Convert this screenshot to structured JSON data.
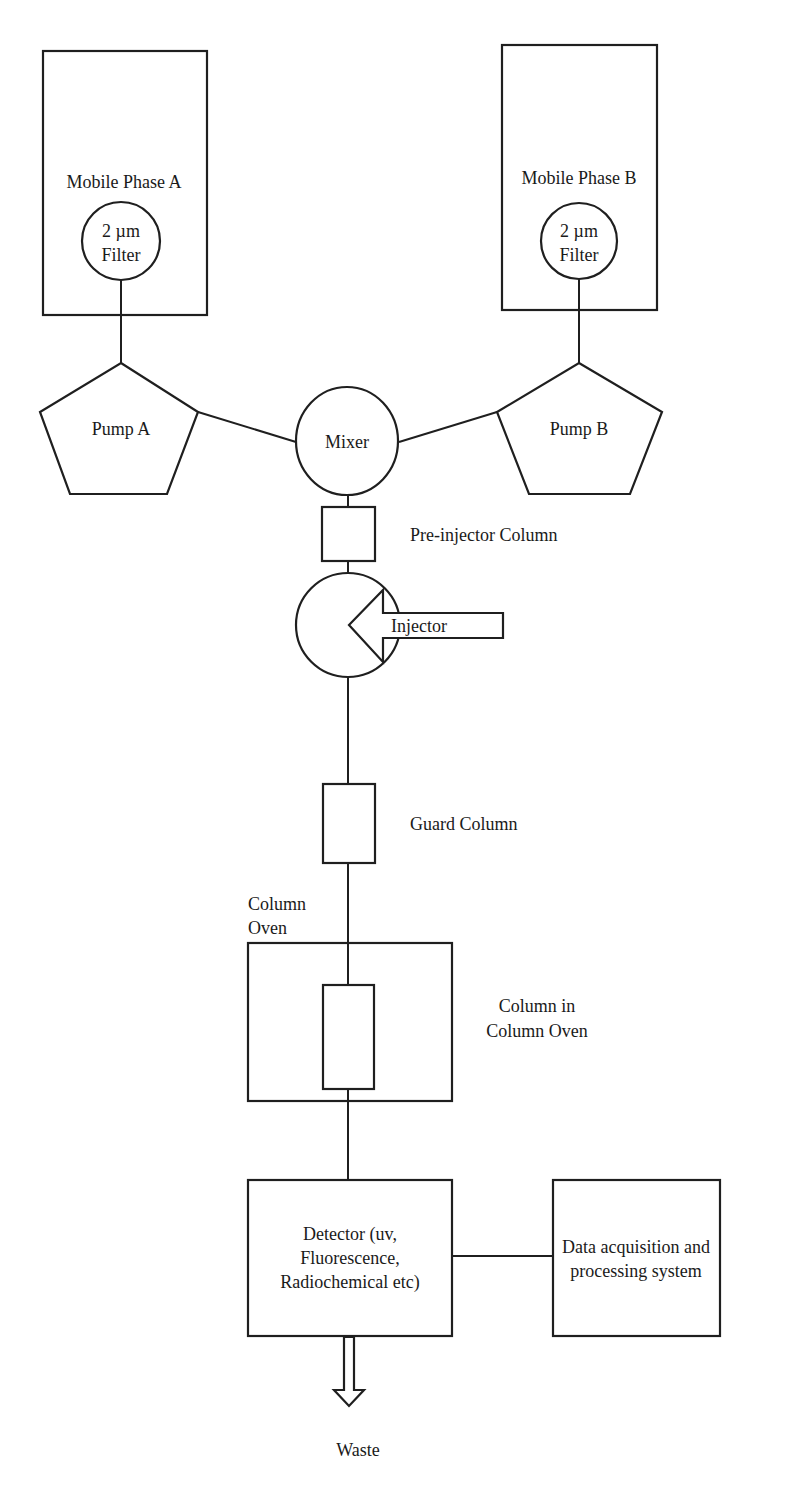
{
  "diagram": {
    "type": "HPLC system schematic",
    "nodes": {
      "mobile_phase_a": {
        "label": "Mobile Phase A"
      },
      "filter_a": {
        "line1": "2 µm",
        "line2": "Filter"
      },
      "mobile_phase_b": {
        "label": "Mobile Phase B"
      },
      "filter_b": {
        "line1": "2 µm",
        "line2": "Filter"
      },
      "pump_a": {
        "label": "Pump A"
      },
      "pump_b": {
        "label": "Pump B"
      },
      "mixer": {
        "label": "Mixer"
      },
      "pre_injector_column": {
        "label": "Pre-injector Column"
      },
      "injector": {
        "label": "Injector"
      },
      "guard_column": {
        "label": "Guard Column"
      },
      "column_oven": {
        "line1": "Column",
        "line2": "Oven"
      },
      "column_in_oven": {
        "line1": "Column in",
        "line2": "Column Oven"
      },
      "detector": {
        "line1": "Detector (uv,",
        "line2": "Fluorescence,",
        "line3": "Radiochemical etc)"
      },
      "data_system": {
        "line1": "Data acquisition and",
        "line2": "processing system"
      },
      "waste": {
        "label": "Waste"
      }
    },
    "edges": [
      [
        "filter_a",
        "pump_a"
      ],
      [
        "filter_b",
        "pump_b"
      ],
      [
        "pump_a",
        "mixer"
      ],
      [
        "pump_b",
        "mixer"
      ],
      [
        "mixer",
        "pre_injector_column"
      ],
      [
        "pre_injector_column",
        "injector"
      ],
      [
        "injector",
        "guard_column"
      ],
      [
        "guard_column",
        "column_in_oven"
      ],
      [
        "column_in_oven",
        "detector"
      ],
      [
        "detector",
        "data_system"
      ],
      [
        "detector",
        "waste"
      ]
    ],
    "colors": {
      "stroke": "#1f1f1f",
      "background": "#ffffff",
      "text": "#1a1a1a"
    }
  }
}
